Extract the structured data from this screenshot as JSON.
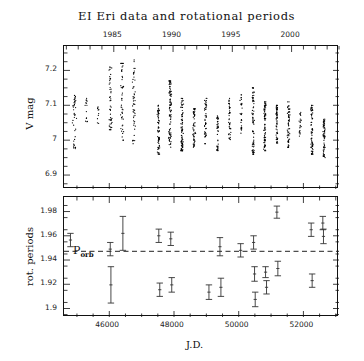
{
  "figure": {
    "title": "EI Eri data and rotational periods",
    "xlabel": "J.D.",
    "top_ylabel": "V mag",
    "bottom_ylabel": "rot. periods",
    "porb_label": "P",
    "porb_sub": "orb"
  },
  "axes": {
    "top_year_ticks": [
      "1985",
      "1990",
      "1995",
      "2000"
    ],
    "top_year_values": [
      1985,
      1990,
      1995,
      2000
    ],
    "jd_ticks": [
      "46000",
      "48000",
      "50000",
      "52000"
    ],
    "jd_tick_values": [
      46000,
      48000,
      50000,
      52000
    ],
    "vmag_ticks": [
      "6.9",
      "7",
      "7.1",
      "7.2"
    ],
    "vmag_tick_values": [
      6.9,
      7.0,
      7.1,
      7.2
    ],
    "period_ticks": [
      "1.98",
      "1.96",
      "1.94",
      "1.92",
      "1.9"
    ],
    "period_tick_values": [
      1.98,
      1.96,
      1.94,
      1.92,
      1.9
    ]
  },
  "chart_data": [
    {
      "type": "scatter",
      "id": "vmag-lightcurve",
      "title": "EI Eri data and rotational periods",
      "xlabel": "J.D.",
      "ylabel": "V mag",
      "xlim": [
        44600,
        53100
      ],
      "ylim": [
        7.27,
        6.86
      ],
      "yinverted": true,
      "grid": false,
      "legend": null,
      "secondary_xaxis": {
        "label": "year",
        "ticks": [
          1985,
          1990,
          1995,
          2000
        ],
        "xlim": [
          1980.8,
          2004.0
        ]
      },
      "marker": "point",
      "color": "#000000",
      "season_clusters": [
        {
          "jd_center": 44930,
          "jd_width": 130,
          "v_min": 6.97,
          "v_max": 7.13,
          "n": 40
        },
        {
          "jd_center": 45290,
          "jd_width": 80,
          "v_min": 7.05,
          "v_max": 7.12,
          "n": 14
        },
        {
          "jd_center": 45660,
          "jd_width": 70,
          "v_min": 7.04,
          "v_max": 7.1,
          "n": 10
        },
        {
          "jd_center": 46030,
          "jd_width": 110,
          "v_min": 7.03,
          "v_max": 7.21,
          "n": 46
        },
        {
          "jd_center": 46400,
          "jd_width": 110,
          "v_min": 7.0,
          "v_max": 7.22,
          "n": 48
        },
        {
          "jd_center": 46760,
          "jd_width": 105,
          "v_min": 6.99,
          "v_max": 7.23,
          "n": 50
        },
        {
          "jd_center": 47520,
          "jd_width": 95,
          "v_min": 6.96,
          "v_max": 7.1,
          "n": 70
        },
        {
          "jd_center": 47880,
          "jd_width": 95,
          "v_min": 6.98,
          "v_max": 7.17,
          "n": 90
        },
        {
          "jd_center": 48250,
          "jd_width": 90,
          "v_min": 6.97,
          "v_max": 7.12,
          "n": 80
        },
        {
          "jd_center": 48620,
          "jd_width": 85,
          "v_min": 6.98,
          "v_max": 7.09,
          "n": 55
        },
        {
          "jd_center": 48980,
          "jd_width": 85,
          "v_min": 6.99,
          "v_max": 7.12,
          "n": 45
        },
        {
          "jd_center": 49350,
          "jd_width": 80,
          "v_min": 6.97,
          "v_max": 7.07,
          "n": 40
        },
        {
          "jd_center": 49720,
          "jd_width": 85,
          "v_min": 7.0,
          "v_max": 7.12,
          "n": 42
        },
        {
          "jd_center": 50080,
          "jd_width": 80,
          "v_min": 7.02,
          "v_max": 7.13,
          "n": 30
        },
        {
          "jd_center": 50450,
          "jd_width": 85,
          "v_min": 6.96,
          "v_max": 7.15,
          "n": 75
        },
        {
          "jd_center": 50810,
          "jd_width": 85,
          "v_min": 6.97,
          "v_max": 7.11,
          "n": 80
        },
        {
          "jd_center": 51180,
          "jd_width": 80,
          "v_min": 6.99,
          "v_max": 7.1,
          "n": 60
        },
        {
          "jd_center": 51540,
          "jd_width": 80,
          "v_min": 6.98,
          "v_max": 7.11,
          "n": 62
        },
        {
          "jd_center": 51900,
          "jd_width": 75,
          "v_min": 7.01,
          "v_max": 7.08,
          "n": 22
        },
        {
          "jd_center": 52270,
          "jd_width": 85,
          "v_min": 6.96,
          "v_max": 7.1,
          "n": 70
        },
        {
          "jd_center": 52640,
          "jd_width": 85,
          "v_min": 6.95,
          "v_max": 7.06,
          "n": 65
        }
      ]
    },
    {
      "type": "scatter",
      "id": "rotational-periods",
      "xlabel": "J.D.",
      "ylabel": "rot. periods",
      "xlim": [
        44600,
        53100
      ],
      "ylim": [
        1.893,
        1.992
      ],
      "grid": false,
      "errorbars": true,
      "reference_line": {
        "label": "P_orb",
        "value": 1.9472,
        "style": "dashed"
      },
      "points": [
        {
          "jd": 44800,
          "period": 1.9565,
          "err": 0.0055
        },
        {
          "jd": 46030,
          "period": 1.949,
          "err": 0.0055
        },
        {
          "jd": 46050,
          "period": 1.9195,
          "err": 0.015
        },
        {
          "jd": 46420,
          "period": 1.962,
          "err": 0.014
        },
        {
          "jd": 47530,
          "period": 1.96,
          "err": 0.0055
        },
        {
          "jd": 47560,
          "period": 1.9155,
          "err": 0.0055
        },
        {
          "jd": 47900,
          "period": 1.9575,
          "err": 0.0055
        },
        {
          "jd": 47930,
          "period": 1.9195,
          "err": 0.006
        },
        {
          "jd": 49080,
          "period": 1.9135,
          "err": 0.006
        },
        {
          "jd": 49420,
          "period": 1.951,
          "err": 0.0075
        },
        {
          "jd": 49450,
          "period": 1.9175,
          "err": 0.0075
        },
        {
          "jd": 50060,
          "period": 1.948,
          "err": 0.0055
        },
        {
          "jd": 50460,
          "period": 1.9545,
          "err": 0.0055
        },
        {
          "jd": 50490,
          "period": 1.9285,
          "err": 0.006
        },
        {
          "jd": 50510,
          "period": 1.9075,
          "err": 0.006
        },
        {
          "jd": 50830,
          "period": 1.93,
          "err": 0.0045
        },
        {
          "jd": 50860,
          "period": 1.9175,
          "err": 0.0055
        },
        {
          "jd": 51180,
          "period": 1.9795,
          "err": 0.005
        },
        {
          "jd": 51210,
          "period": 1.933,
          "err": 0.006
        },
        {
          "jd": 52240,
          "period": 1.965,
          "err": 0.0055
        },
        {
          "jd": 52270,
          "period": 1.923,
          "err": 0.0055
        },
        {
          "jd": 52600,
          "period": 1.9705,
          "err": 0.0055
        },
        {
          "jd": 52620,
          "period": 1.9595,
          "err": 0.006
        }
      ]
    }
  ]
}
